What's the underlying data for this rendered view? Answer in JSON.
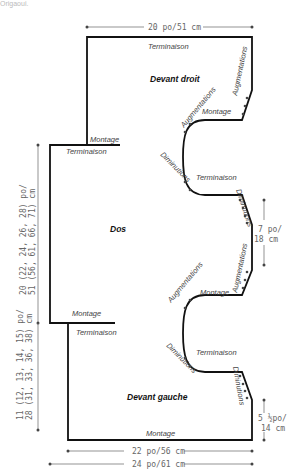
{
  "header": {
    "fragment": "Origaoui."
  },
  "pieces": {
    "right_front": {
      "title": "Devant droit"
    },
    "back": {
      "title": "Dos"
    },
    "left_front": {
      "title": "Devant gauche"
    }
  },
  "labels": {
    "terminaison": "Terminaison",
    "montage": "Montage",
    "augmentations": "Augmentations",
    "diminutions": "Diminutions"
  },
  "measurements": {
    "top_width": "20 po/51 cm",
    "back_length_line1": "20 (22, 24, 26, 28) po/",
    "back_length_line2": "51 (56, 61, 66, 71) cm",
    "front_length_line1": "11 (12, 13, 14, 15) po/",
    "front_length_line2": "28 (31, 33, 36, 38) cm",
    "armhole_line1": "7 po/",
    "armhole_line2": "18 cm",
    "lower_side_line1": "5 ½po/",
    "lower_side_line2": "14 cm",
    "bottom_width_inner": "22 po/56 cm",
    "bottom_width_outer": "24 po/61 cm"
  },
  "colors": {
    "outline": "#111111",
    "dimension": "#666666",
    "text": "#444444"
  }
}
